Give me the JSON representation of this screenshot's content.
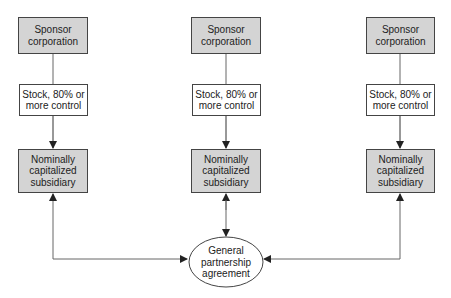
{
  "diagram": {
    "columns": [
      {
        "sponsor": "Sponsor corporation",
        "stock": "Stock, 80% or more control",
        "subsidiary": "Nominally capitalized subsidiary"
      },
      {
        "sponsor": "Sponsor corporation",
        "stock": "Stock, 80% or more control",
        "subsidiary": "Nominally capitalized subsidiary"
      },
      {
        "sponsor": "Sponsor corporation",
        "stock": "Stock, 80% or more control",
        "subsidiary": "Nominally capitalized subsidiary"
      }
    ],
    "agreement": "General partnership agreement",
    "colors": {
      "shaded_fill": "#d4d4d4",
      "border": "#444444",
      "line": "#555555"
    }
  }
}
